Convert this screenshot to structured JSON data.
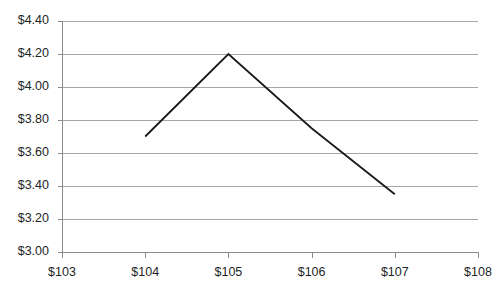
{
  "chart_data": {
    "type": "line",
    "title": "",
    "subtitle": "",
    "xlabel": "",
    "ylabel": "",
    "grid": true,
    "legend": false,
    "legend_position": "none",
    "line_color": "#1a1a1a",
    "grid_color": "#a6a6a6",
    "axis_color": "#8c8c8c",
    "background_color": "#ffffff",
    "x": [
      104,
      105,
      106,
      107
    ],
    "values": [
      3.7,
      4.2,
      3.75,
      3.35
    ],
    "points": [
      {
        "x": "$104",
        "y": "$3.70"
      },
      {
        "x": "$105",
        "y": "$4.20"
      },
      {
        "x": "$106",
        "y": "$3.75"
      },
      {
        "x": "$107",
        "y": "$3.35"
      }
    ],
    "xlim": [
      103,
      108
    ],
    "ylim": [
      3.0,
      4.4
    ],
    "x_ticks": [
      103,
      104,
      105,
      106,
      107,
      108
    ],
    "y_ticks": [
      3.0,
      3.2,
      3.4,
      3.6,
      3.8,
      4.0,
      4.2,
      4.4
    ],
    "x_tick_labels": [
      "$103",
      "$104",
      "$105",
      "$106",
      "$107",
      "$108"
    ],
    "y_tick_labels": [
      "$3.00",
      "$3.20",
      "$3.40",
      "$3.60",
      "$3.80",
      "$4.00",
      "$4.20",
      "$4.40"
    ]
  },
  "plot_geometry": {
    "left": 62,
    "right": 478,
    "top": 21,
    "bottom": 252,
    "tick_length": 5,
    "y_label_gap": 8,
    "x_label_gap": 10
  }
}
